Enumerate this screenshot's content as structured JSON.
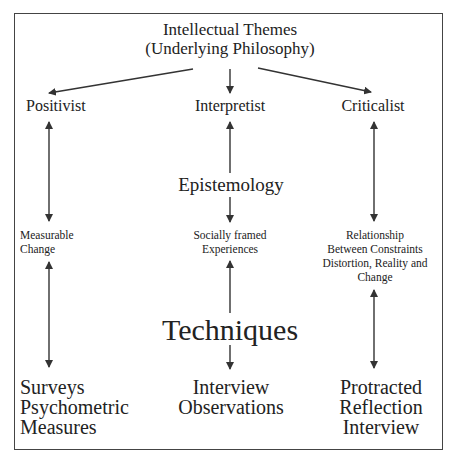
{
  "diagram": {
    "title": [
      "Intellectual Themes",
      "(Underlying Philosophy)"
    ],
    "columns": [
      {
        "id": "positivist",
        "heading": "Positivist",
        "middle": [
          "Measurable",
          "Change"
        ],
        "bottom": [
          "Surveys",
          "Psychometric",
          "Measures"
        ]
      },
      {
        "id": "interpretist",
        "heading": "Interpretist",
        "middle": [
          "Socially framed",
          "Experiences"
        ],
        "bottom": [
          "Interview",
          "Observations"
        ]
      },
      {
        "id": "criticalist",
        "heading": "Criticalist",
        "middle": [
          "Relationship",
          "Between Constraints",
          "Distortion, Reality and",
          "Change"
        ],
        "bottom": [
          "Protracted",
          "Reflection",
          "Interview"
        ]
      }
    ],
    "center_labels": {
      "epistemology": "Epistemology",
      "techniques": "Techniques"
    },
    "edges": [
      {
        "from": "title",
        "to": "positivist",
        "type": "arrow"
      },
      {
        "from": "title",
        "to": "interpretist",
        "type": "arrow"
      },
      {
        "from": "title",
        "to": "criticalist",
        "type": "arrow"
      },
      {
        "from": "positivist",
        "to": "measurable-change",
        "type": "double-arrow"
      },
      {
        "from": "measurable-change",
        "to": "surveys",
        "type": "double-arrow"
      },
      {
        "from": "epistemology",
        "to": "interpretist",
        "type": "arrow"
      },
      {
        "from": "epistemology",
        "to": "socially-framed-experiences",
        "type": "arrow"
      },
      {
        "from": "techniques",
        "to": "socially-framed-experiences",
        "type": "arrow"
      },
      {
        "from": "techniques",
        "to": "interview-observations",
        "type": "arrow"
      },
      {
        "from": "criticalist",
        "to": "relationship",
        "type": "double-arrow"
      },
      {
        "from": "relationship",
        "to": "protracted-reflection",
        "type": "double-arrow"
      }
    ],
    "colors": {
      "text": "#222222",
      "line": "#333333",
      "frame": "#444444",
      "background": "#ffffff"
    }
  }
}
